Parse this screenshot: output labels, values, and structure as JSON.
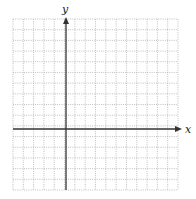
{
  "diagram": {
    "type": "blank coordinate plane",
    "grid": {
      "left": 13,
      "top": 19,
      "right": 178,
      "bottom": 190,
      "columns": 16,
      "rows": 16,
      "line_style": "dotted",
      "line_color": "#b0b0b0"
    },
    "axes": {
      "color": "#333333",
      "x_axis": {
        "label": "x",
        "y_position": 129,
        "arrow": "right",
        "end_x": 182
      },
      "y_axis": {
        "label": "y",
        "x_position": 66,
        "arrow": "up",
        "end_y": 17
      }
    }
  }
}
